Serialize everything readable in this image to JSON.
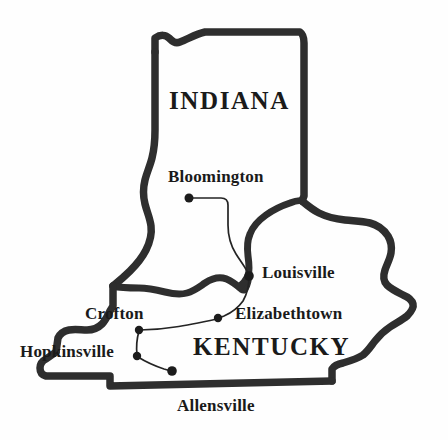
{
  "map": {
    "title": "Indiana and Kentucky region map",
    "background_color": "#fefefe",
    "border_color": "#2e2e2e",
    "road_color": "#242424",
    "dot_color": "#1c1c1c",
    "states": [
      {
        "name": "INDIANA",
        "label": "INDIANA"
      },
      {
        "name": "KENTUCKY",
        "label": "KENTUCKY"
      }
    ],
    "cities": [
      {
        "id": "bloomington",
        "label": "Bloomington",
        "x": 189,
        "y": 198
      },
      {
        "id": "louisville",
        "label": "Louisville",
        "x": 249,
        "y": 276
      },
      {
        "id": "elizabethtown",
        "label": "Elizabethtown",
        "x": 218,
        "y": 318
      },
      {
        "id": "crofton",
        "label": "Crofton",
        "x": 139,
        "y": 330
      },
      {
        "id": "hopkinsville",
        "label": "Hopkinsville",
        "x": 137,
        "y": 356
      },
      {
        "id": "allensville",
        "label": "Allensville",
        "x": 172,
        "y": 371
      }
    ],
    "labels": {
      "indiana": "INDIANA",
      "kentucky": "KENTUCKY",
      "bloomington": "Bloomington",
      "louisville": "Louisville",
      "elizabethtown": "Elizabethtown",
      "crofton": "Crofton",
      "hopkinsville": "Hopkinsville",
      "allensville": "Allensville"
    }
  }
}
